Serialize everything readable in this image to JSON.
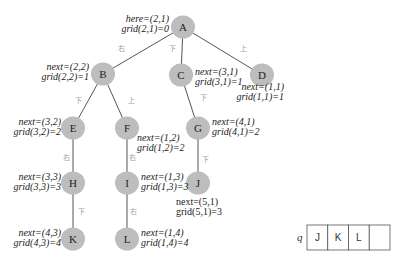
{
  "tree": {
    "nodes": [
      {
        "id": "A",
        "label": "A",
        "x": 183,
        "y": 27
      },
      {
        "id": "B",
        "label": "B",
        "x": 103,
        "y": 74
      },
      {
        "id": "C",
        "label": "C",
        "x": 181,
        "y": 75
      },
      {
        "id": "D",
        "label": "D",
        "x": 262,
        "y": 75
      },
      {
        "id": "E",
        "label": "E",
        "x": 73,
        "y": 128
      },
      {
        "id": "F",
        "label": "F",
        "x": 127,
        "y": 128
      },
      {
        "id": "G",
        "label": "G",
        "x": 198,
        "y": 128
      },
      {
        "id": "H",
        "label": "H",
        "x": 73,
        "y": 183
      },
      {
        "id": "I",
        "label": "I",
        "x": 127,
        "y": 183
      },
      {
        "id": "J",
        "label": "J",
        "x": 198,
        "y": 183
      },
      {
        "id": "K",
        "label": "K",
        "x": 73,
        "y": 239
      },
      {
        "id": "L",
        "label": "L",
        "x": 127,
        "y": 239
      }
    ],
    "edges": [
      {
        "from": "A",
        "to": "B",
        "label": "右",
        "lx": 121,
        "ly": 51
      },
      {
        "from": "A",
        "to": "C",
        "label": "下",
        "lx": 172,
        "ly": 51
      },
      {
        "from": "A",
        "to": "D",
        "label": "上",
        "lx": 243,
        "ly": 51
      },
      {
        "from": "B",
        "to": "E",
        "label": "下",
        "lx": 78,
        "ly": 103
      },
      {
        "from": "B",
        "to": "F",
        "label": "上",
        "lx": 131,
        "ly": 103
      },
      {
        "from": "C",
        "to": "G",
        "label": "下",
        "lx": 203,
        "ly": 100
      },
      {
        "from": "E",
        "to": "H",
        "label": "右",
        "lx": 66,
        "ly": 160
      },
      {
        "from": "F",
        "to": "I",
        "label": "右",
        "lx": 132,
        "ly": 160
      },
      {
        "from": "G",
        "to": "J",
        "label": "下",
        "lx": 205,
        "ly": 162
      },
      {
        "from": "H",
        "to": "K",
        "label": "下",
        "lx": 81,
        "ly": 214
      },
      {
        "from": "I",
        "to": "L",
        "label": "右",
        "lx": 133,
        "ly": 214
      }
    ],
    "annotations": [
      {
        "node": "A",
        "line1": "here=(2,1)",
        "line2": "grid(2,1)=0",
        "x": 169,
        "y": 22,
        "anchor": "end",
        "italic": true
      },
      {
        "node": "B",
        "line1": "next=(2,2)",
        "line2": "grid(2,2)=1",
        "x": 89,
        "y": 70,
        "anchor": "end",
        "italic": true
      },
      {
        "node": "C",
        "line1": "next=(3,1)",
        "line2": "grid(3,1)=1",
        "x": 195,
        "y": 75,
        "anchor": "start",
        "italic": true
      },
      {
        "node": "D",
        "line1": "next=(1,1)",
        "line2": "grid(1,1)=1",
        "x": 284,
        "y": 90,
        "anchor": "end",
        "italic": true
      },
      {
        "node": "E",
        "line1": "next=(3,2)",
        "line2": "grid(3,2)=2",
        "x": 61,
        "y": 125,
        "anchor": "end",
        "italic": true
      },
      {
        "node": "F",
        "line1": "next=(1,2)",
        "line2": "grid(1,2)=2",
        "x": 137,
        "y": 141,
        "anchor": "start",
        "italic": true
      },
      {
        "node": "G",
        "line1": "next=(4,1)",
        "line2": "grid(4,1)=2",
        "x": 212,
        "y": 125,
        "anchor": "start",
        "italic": true
      },
      {
        "node": "H",
        "line1": "next=(3,3)",
        "line2": "grid(3,3)=3",
        "x": 61,
        "y": 180,
        "anchor": "end",
        "italic": true
      },
      {
        "node": "I",
        "line1": "next=(1,3)",
        "line2": "grid(1,3)=3",
        "x": 141,
        "y": 180,
        "anchor": "start",
        "italic": true
      },
      {
        "node": "J",
        "line1": "next=(5,1)",
        "line2": "grid(5,1)=3",
        "x": 176,
        "y": 205,
        "anchor": "start",
        "italic": false
      },
      {
        "node": "K",
        "line1": "next=(4,3)",
        "line2": "grid(4,3)=4",
        "x": 61,
        "y": 236,
        "anchor": "end",
        "italic": true
      },
      {
        "node": "L",
        "line1": "next=(1,4)",
        "line2": "grid(1,4)=4",
        "x": 141,
        "y": 236,
        "anchor": "start",
        "italic": true
      }
    ]
  },
  "queue": {
    "name": "q",
    "cells": [
      "J",
      "K",
      "L",
      ""
    ]
  }
}
